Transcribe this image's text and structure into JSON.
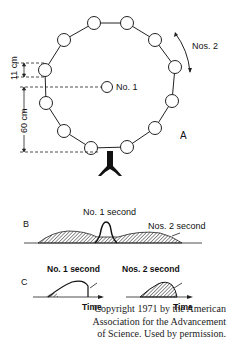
{
  "panel_a": {
    "letter": "A",
    "center_label": "No. 1",
    "arrow_label": "Nos. 2",
    "dim_small": "11 cm",
    "dim_large": "60 cm",
    "ring_circle_count": 14
  },
  "panel_b": {
    "letter": "B",
    "label_center": "No. 1 second",
    "label_right": "Nos. 2 second"
  },
  "panel_c": {
    "letter": "C",
    "left_label": "No. 1 second",
    "right_label": "Nos. 2 second",
    "left_axis": "Time",
    "right_axis": "Time"
  },
  "copyright": {
    "line1": "Copyright 1971 by the American",
    "line2": "Association for the Advancement",
    "line3": "of Science. Used by permission."
  }
}
